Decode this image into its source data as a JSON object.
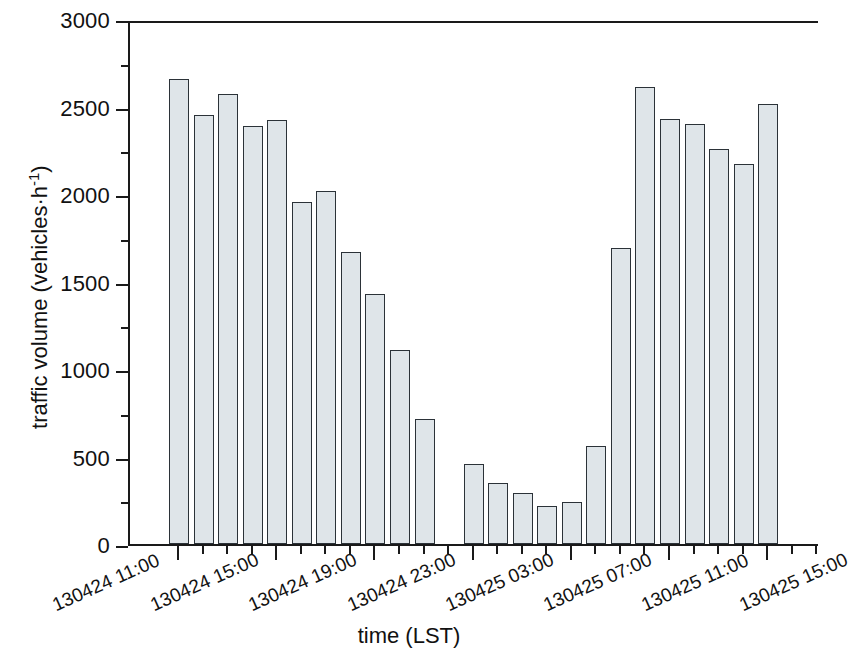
{
  "chart_data": {
    "type": "bar",
    "title": "",
    "xlabel": "time (LST)",
    "ylabel": "traffic volume (vehicles·h⁻¹)",
    "ylabel_main": "traffic volume (vehicles·h",
    "ylabel_exponent": "-1",
    "ylabel_close": ")",
    "ylim": [
      0,
      3000
    ],
    "ytick_labels": [
      "3000",
      "2500",
      "2000",
      "1500",
      "1000",
      "500",
      "0"
    ],
    "ytick_values": [
      3000,
      2500,
      2000,
      1500,
      1000,
      500,
      0
    ],
    "yminor_values": [
      2750,
      2250,
      1750,
      1250,
      750,
      250
    ],
    "grid": false,
    "legend": null,
    "bar_color": "#dfe5e9",
    "bar_edge_color": "#2b3238",
    "axis_color": "#1a1a1a",
    "xtick_labels": [
      "130424 11:00",
      "130424 15:00",
      "130424 19:00",
      "130424 23:00",
      "130425 03:00",
      "130425 07:00",
      "130425 11:00",
      "130425 15:00"
    ],
    "categories": [
      "130424 11:00",
      "130424 12:00",
      "130424 13:00",
      "130424 14:00",
      "130424 15:00",
      "130424 16:00",
      "130424 17:00",
      "130424 18:00",
      "130424 19:00",
      "130424 20:00",
      "130424 21:00",
      "130424 22:00",
      "130424 23:00",
      "130425 00:00",
      "130425 01:00",
      "130425 02:00",
      "130425 03:00",
      "130425 04:00",
      "130425 05:00",
      "130425 06:00",
      "130425 07:00",
      "130425 08:00",
      "130425 09:00",
      "130425 10:00",
      "130425 11:00",
      "130425 12:00",
      "130425 13:00",
      "130425 14:00"
    ],
    "values": [
      2660,
      2450,
      2570,
      2390,
      2425,
      1955,
      2015,
      1670,
      1430,
      1110,
      715,
      null,
      460,
      350,
      290,
      215,
      240,
      560,
      1690,
      2610,
      2430,
      2400,
      2255,
      2170,
      2515,
      null,
      null,
      null
    ]
  }
}
